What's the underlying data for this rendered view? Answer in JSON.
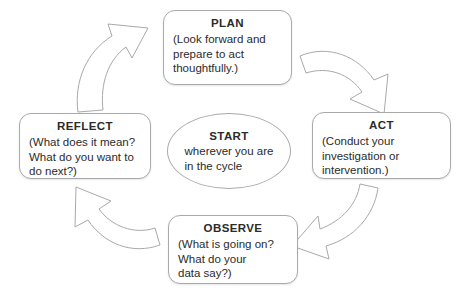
{
  "diagram": {
    "background_color": "#ffffff",
    "stroke_color": "#a9a9a9",
    "text_color": "#2b2b2b",
    "center": {
      "shape": "ellipse",
      "title": "START",
      "lines": [
        "wherever you are",
        "in the cycle"
      ]
    },
    "stages": [
      {
        "id": "plan",
        "title": "PLAN",
        "lines": [
          "(Look forward and",
          "prepare to act",
          "thoughtfully.)"
        ]
      },
      {
        "id": "act",
        "title": "ACT",
        "lines": [
          "(Conduct your",
          "investigation or",
          "intervention.)"
        ]
      },
      {
        "id": "observe",
        "title": "OBSERVE",
        "lines": [
          "(What is going on?",
          "What do your",
          "data say?)"
        ]
      },
      {
        "id": "reflect",
        "title": "REFLECT",
        "lines": [
          "(What does it mean?",
          "What do you want to",
          "do next?)"
        ]
      }
    ],
    "arrows": [
      {
        "id": "reflect-to-plan",
        "from": "REFLECT",
        "to": "PLAN",
        "direction": "clockwise"
      },
      {
        "id": "plan-to-act",
        "from": "PLAN",
        "to": "ACT",
        "direction": "clockwise"
      },
      {
        "id": "act-to-observe",
        "from": "ACT",
        "to": "OBSERVE",
        "direction": "clockwise"
      },
      {
        "id": "observe-to-reflect",
        "from": "OBSERVE",
        "to": "REFLECT",
        "direction": "clockwise"
      }
    ]
  }
}
